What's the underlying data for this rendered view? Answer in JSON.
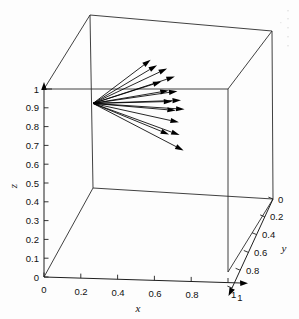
{
  "figure": {
    "kind": "3d-quiver-plot",
    "background_color": "#fdfdfd",
    "line_color": "#000000",
    "width": 299,
    "height": 319
  },
  "axes": {
    "x": {
      "title": "x",
      "tick_labels": [
        "0",
        "0.2",
        "0.4",
        "0.6",
        "0.8",
        "1"
      ],
      "tick_values": [
        0,
        0.2,
        0.4,
        0.6,
        0.8,
        1
      ],
      "range": [
        0,
        1
      ]
    },
    "y": {
      "title": "y",
      "tick_labels": [
        "0",
        "0.2",
        "0.4",
        "0.6",
        "0.8",
        "1"
      ],
      "tick_values": [
        0,
        0.2,
        0.4,
        0.6,
        0.8,
        1
      ],
      "range": [
        0,
        1
      ]
    },
    "z": {
      "title": "z",
      "tick_labels": [
        "0",
        "0.1",
        "0.2",
        "0.3",
        "0.4",
        "0.5",
        "0.6",
        "0.7",
        "0.8",
        "0.9",
        "1"
      ],
      "tick_values": [
        0,
        0.1,
        0.2,
        0.3,
        0.4,
        0.5,
        0.6,
        0.7,
        0.8,
        0.9,
        1
      ],
      "range": [
        0,
        1
      ]
    }
  },
  "chart_data": {
    "type": "scatter",
    "subtype": "3d-quiver",
    "title": "",
    "xlabel": "x",
    "ylabel": "y",
    "zlabel": "z",
    "xlim": [
      0,
      1
    ],
    "ylim": [
      0,
      1
    ],
    "zlim": [
      0,
      1
    ],
    "grid": false,
    "legend": null,
    "origin": {
      "x": 0.0,
      "y": 1.0,
      "z": 0.45
    },
    "vector_count": 15,
    "vectors": [
      {
        "tip": {
          "x": 0.42,
          "y": 0.6,
          "z": 0.86
        }
      },
      {
        "tip": {
          "x": 0.46,
          "y": 0.58,
          "z": 0.84
        }
      },
      {
        "tip": {
          "x": 0.52,
          "y": 0.56,
          "z": 0.83
        }
      },
      {
        "tip": {
          "x": 0.5,
          "y": 0.52,
          "z": 0.78
        }
      },
      {
        "tip": {
          "x": 0.57,
          "y": 0.53,
          "z": 0.8
        }
      },
      {
        "tip": {
          "x": 0.55,
          "y": 0.48,
          "z": 0.75
        }
      },
      {
        "tip": {
          "x": 0.6,
          "y": 0.47,
          "z": 0.75
        }
      },
      {
        "tip": {
          "x": 0.58,
          "y": 0.44,
          "z": 0.71
        }
      },
      {
        "tip": {
          "x": 0.63,
          "y": 0.43,
          "z": 0.72
        }
      },
      {
        "tip": {
          "x": 0.61,
          "y": 0.4,
          "z": 0.68
        }
      },
      {
        "tip": {
          "x": 0.66,
          "y": 0.39,
          "z": 0.69
        }
      },
      {
        "tip": {
          "x": 0.64,
          "y": 0.35,
          "z": 0.64
        }
      },
      {
        "tip": {
          "x": 0.6,
          "y": 0.3,
          "z": 0.6
        }
      },
      {
        "tip": {
          "x": 0.66,
          "y": 0.29,
          "z": 0.6
        }
      },
      {
        "tip": {
          "x": 0.7,
          "y": 0.22,
          "z": 0.55
        }
      }
    ]
  },
  "geometry": {
    "note": "screen-space projected cube corners in pixels",
    "cube": {
      "front_bottom_left": [
        44,
        277
      ],
      "front_bottom_right": [
        228,
        272
      ],
      "back_bottom_left": [
        93,
        188
      ],
      "back_bottom_right": [
        273,
        199
      ],
      "front_top_left": [
        44,
        89
      ],
      "front_top_right": [
        228,
        89
      ],
      "back_top_left": [
        90,
        15
      ],
      "back_top_right": [
        272,
        31
      ]
    }
  }
}
